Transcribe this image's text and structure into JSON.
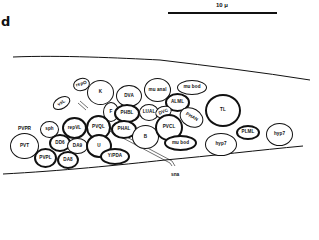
{
  "panel": {
    "label": "d"
  },
  "scale": {
    "label": "10 μ"
  },
  "nerve_label": "sna",
  "cells": [
    {
      "name": "repO",
      "label": "repO"
    },
    {
      "name": "K",
      "label": "K"
    },
    {
      "name": "DVA",
      "label": "DVA"
    },
    {
      "name": "mu-anal",
      "label": "mu anal"
    },
    {
      "name": "mu-bod-top",
      "label": "mu bod"
    },
    {
      "name": "ALML",
      "label": "ALML"
    },
    {
      "name": "vsL",
      "label": "vsL"
    },
    {
      "name": "F",
      "label": "F"
    },
    {
      "name": "PHBL",
      "label": "PHBL"
    },
    {
      "name": "LUAL",
      "label": "LUAL"
    },
    {
      "name": "DVC",
      "label": "DVC"
    },
    {
      "name": "TL",
      "label": "TL"
    },
    {
      "name": "sph",
      "label": "sph"
    },
    {
      "name": "repVL",
      "label": "repVL"
    },
    {
      "name": "PVQL",
      "label": "PVQL"
    },
    {
      "name": "PHAL",
      "label": "PHAL"
    },
    {
      "name": "B",
      "label": "B"
    },
    {
      "name": "PVCL",
      "label": "PVCL"
    },
    {
      "name": "PHAN",
      "label": "PHAN"
    },
    {
      "name": "PLML",
      "label": "PLML"
    },
    {
      "name": "hyp7-right",
      "label": "hyp7"
    },
    {
      "name": "hyp7-left",
      "label": "hyp7"
    },
    {
      "name": "PVT",
      "label": "PVT"
    },
    {
      "name": "DD6",
      "label": "DD6"
    },
    {
      "name": "DA9",
      "label": "DA9"
    },
    {
      "name": "U",
      "label": "U"
    },
    {
      "name": "PVPL",
      "label": "PVPL"
    },
    {
      "name": "DA8",
      "label": "DA8"
    },
    {
      "name": "Y-PDA",
      "label": "Y/PDA"
    },
    {
      "name": "mu-bod-bottom",
      "label": "mu bod"
    }
  ],
  "free_labels": {
    "PVPR": "PVPR"
  }
}
